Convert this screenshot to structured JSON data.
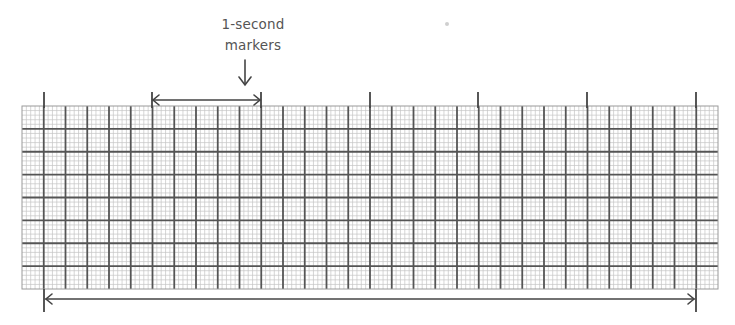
{
  "annotation": {
    "label_line1": "1-second",
    "label_line2": "markers"
  },
  "grid": {
    "left": 22,
    "top": 106,
    "right": 718,
    "bottom": 289,
    "columns": 32,
    "rows": 8,
    "small_divisions_per_big": 5,
    "major_line_color": "#555555",
    "minor_line_color": "#c4c4c4",
    "border_color": "#9a9a9a"
  },
  "markers": {
    "x_positions": [
      44,
      152,
      261,
      370,
      478,
      587,
      696
    ],
    "top_y": 92,
    "color": "#444444"
  },
  "spans": [
    {
      "name": "one-second-span",
      "x1": 153,
      "x2": 260,
      "y": 100
    },
    {
      "name": "total-span",
      "x1": 46,
      "x2": 694,
      "y": 299
    }
  ],
  "bottom_markers": {
    "x_positions": [
      44,
      696
    ],
    "bottom_y": 312
  }
}
